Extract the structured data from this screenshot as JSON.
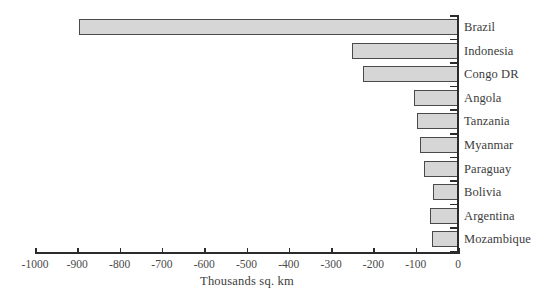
{
  "chart_data": {
    "type": "bar",
    "orientation": "horizontal",
    "title": "",
    "subtitle": "",
    "xlabel": "Thousands sq. km",
    "ylabel": "",
    "categories": [
      "Brazil",
      "Indonesia",
      "Congo DR",
      "Angola",
      "Tanzania",
      "Myanmar",
      "Paraguay",
      "Bolivia",
      "Argentina",
      "Mozambique"
    ],
    "values": [
      -897,
      -250,
      -225,
      -105,
      -97,
      -90,
      -80,
      -60,
      -66,
      -62
    ],
    "series": [
      {
        "name": "Forest area change",
        "values": [
          -897,
          -250,
          -225,
          -105,
          -97,
          -90,
          -80,
          -60,
          -66,
          -62
        ]
      }
    ],
    "xlim": [
      -1000,
      0
    ],
    "xticks": [
      -1000,
      -900,
      -800,
      -700,
      -600,
      -500,
      -400,
      -300,
      -200,
      -100,
      0
    ],
    "xtick_labels": [
      "-1000",
      "-900",
      "-800",
      "-700",
      "-600",
      "-500",
      "-400",
      "-300",
      "-200",
      "-100",
      "0"
    ],
    "grid": false,
    "legend": false,
    "bar_fill_color": "#d6d6d6",
    "bar_edge_color": "#4a4a4a",
    "axis_color": "#2b2b2b",
    "text_color": "#3c3c3c",
    "background_color": "#ffffff"
  }
}
